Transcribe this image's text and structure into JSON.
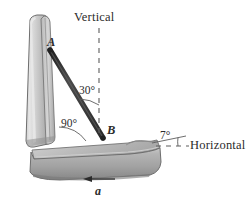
{
  "figure": {
    "background_color": "#ffffff",
    "ink_color": "#2b2b2b",
    "seat_fill_light": "#d9d9d9",
    "seat_fill_mid": "#b0b0b0",
    "seat_fill_dark": "#8a8a8a",
    "bar_color": "#3a3a3a"
  },
  "labels": {
    "vertical": "Vertical",
    "horizontal": "Horizontal",
    "point_a": "A",
    "point_b": "B",
    "angle_30": "30°",
    "angle_90": "90°",
    "angle_7": "7°",
    "acceleration": "a"
  },
  "geometry": {
    "point_a": {
      "x": 50,
      "y": 50
    },
    "point_b": {
      "x": 103,
      "y": 137
    },
    "vertical_dashed_line": {
      "x": 99,
      "y_top": 28,
      "y_bottom": 136
    },
    "horizontal_dashed_line": {
      "x_left": 156,
      "x_right": 188,
      "y": 146
    },
    "bar_angle_from_vertical_deg": 30,
    "back_to_seat_angle_deg": 90,
    "seat_incline_from_horizontal_deg": 7,
    "acceleration_arrow": {
      "x_tail": 115,
      "x_head": 84,
      "y": 179,
      "direction": "left"
    }
  }
}
